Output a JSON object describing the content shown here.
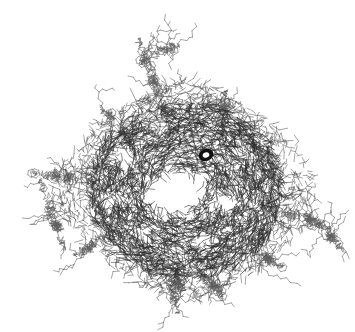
{
  "figure": {
    "kind": "molecular-wireframe",
    "description": "Dense toroidal core of overlapping bond segments with a light central cavity, surrounded by sparse radiating branched chains",
    "width": 355,
    "height": 332,
    "background_color": "#ffffff",
    "line_color_core": "#2b2b2b",
    "line_color_mid": "#4a4a4a",
    "line_color_tendril": "#606060",
    "bounds": {
      "left": 18,
      "top": 28,
      "right": 345,
      "bottom": 315
    }
  },
  "chart_data": {
    "type": "scatter",
    "xlabel": "",
    "ylabel": "",
    "xlim": [
      0,
      355
    ],
    "ylim": [
      0,
      332
    ],
    "grid": false,
    "legend": null,
    "core": {
      "center_x": 186,
      "center_y": 190,
      "outer_radius_x": 96,
      "outer_radius_y": 88,
      "cavity_center_x": 172,
      "cavity_center_y": 196,
      "cavity_radius_x": 26,
      "cavity_radius_y": 22,
      "segment_count": 5200,
      "segment_length_min": 3,
      "segment_length_max": 9,
      "stroke_width": 0.55
    },
    "mid_shell": {
      "center_x": 186,
      "center_y": 190,
      "radius_min": 80,
      "radius_max": 118,
      "segment_count": 1200,
      "stroke_width": 0.5
    },
    "voids": [
      {
        "x": 120,
        "y": 160,
        "rx": 13,
        "ry": 11
      },
      {
        "x": 152,
        "y": 122,
        "rx": 12,
        "ry": 9
      },
      {
        "x": 228,
        "y": 198,
        "rx": 10,
        "ry": 9
      },
      {
        "x": 206,
        "y": 240,
        "rx": 9,
        "ry": 8
      },
      {
        "x": 146,
        "y": 236,
        "rx": 8,
        "ry": 7
      },
      {
        "x": 240,
        "y": 150,
        "rx": 8,
        "ry": 7
      },
      {
        "x": 112,
        "y": 206,
        "rx": 9,
        "ry": 8
      }
    ],
    "dark_blob": {
      "x": 206,
      "y": 155,
      "outer_rx": 7.5,
      "outer_ry": 6.0,
      "inner_rx": 3.4,
      "inner_ry": 2.6,
      "rotation": -22,
      "color": "#111111"
    },
    "tendrils": [
      {
        "name": "tendril-north",
        "start_x": 168,
        "start_y": 120,
        "end_x": 138,
        "end_y": 36,
        "segments": 120,
        "spread": 26,
        "branch_prob": 0.42
      },
      {
        "name": "tendril-north-loop",
        "start_x": 140,
        "start_y": 60,
        "end_x": 182,
        "end_y": 44,
        "segments": 70,
        "spread": 20,
        "branch_prob": 0.45
      },
      {
        "name": "tendril-northeast",
        "start_x": 222,
        "start_y": 130,
        "end_x": 226,
        "end_y": 88,
        "segments": 60,
        "spread": 16,
        "branch_prob": 0.4
      },
      {
        "name": "tendril-northwest",
        "start_x": 126,
        "start_y": 140,
        "end_x": 100,
        "end_y": 104,
        "segments": 60,
        "spread": 18,
        "branch_prob": 0.4
      },
      {
        "name": "tendril-west-upper",
        "start_x": 96,
        "start_y": 182,
        "end_x": 30,
        "end_y": 172,
        "segments": 90,
        "spread": 20,
        "branch_prob": 0.44
      },
      {
        "name": "tendril-west-lower",
        "start_x": 40,
        "start_y": 178,
        "end_x": 66,
        "end_y": 252,
        "segments": 95,
        "spread": 22,
        "branch_prob": 0.44
      },
      {
        "name": "tendril-southwest",
        "start_x": 104,
        "start_y": 236,
        "end_x": 72,
        "end_y": 258,
        "segments": 55,
        "spread": 16,
        "branch_prob": 0.38
      },
      {
        "name": "tendril-south",
        "start_x": 176,
        "start_y": 268,
        "end_x": 178,
        "end_y": 312,
        "segments": 85,
        "spread": 26,
        "branch_prob": 0.44
      },
      {
        "name": "tendril-south-east",
        "start_x": 200,
        "start_y": 270,
        "end_x": 224,
        "end_y": 300,
        "segments": 60,
        "spread": 20,
        "branch_prob": 0.4
      },
      {
        "name": "tendril-east",
        "start_x": 268,
        "start_y": 206,
        "end_x": 332,
        "end_y": 228,
        "segments": 100,
        "spread": 20,
        "branch_prob": 0.44
      },
      {
        "name": "tendril-east-tip",
        "start_x": 318,
        "start_y": 222,
        "end_x": 344,
        "end_y": 252,
        "segments": 55,
        "spread": 16,
        "branch_prob": 0.4
      },
      {
        "name": "tendril-southeast",
        "start_x": 252,
        "start_y": 250,
        "end_x": 286,
        "end_y": 268,
        "segments": 50,
        "spread": 16,
        "branch_prob": 0.38
      }
    ]
  }
}
